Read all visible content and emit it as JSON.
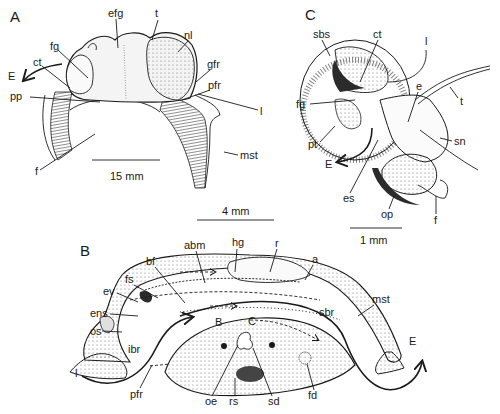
{
  "figure": {
    "panels": [
      {
        "id": "A",
        "label": "A",
        "scale_bar": "15 mm",
        "labels": [
          "efg",
          "t",
          "nl",
          "fg",
          "ct",
          "E",
          "gfr",
          "pfr",
          "l",
          "pp",
          "mst",
          "f"
        ]
      },
      {
        "id": "B",
        "label": "B",
        "scale_bar": "4 mm",
        "labels": [
          "abm",
          "hg",
          "r",
          "a",
          "bf",
          "fs",
          "ev",
          "ens",
          "os",
          "ibr",
          "l",
          "pfr",
          "B",
          "C",
          "sbr",
          "mst",
          "E",
          "oe",
          "rs",
          "sd",
          "fd"
        ]
      },
      {
        "id": "C",
        "label": "C",
        "scale_bar": "1 mm",
        "labels": [
          "sbs",
          "ct",
          "l",
          "e",
          "t",
          "fg",
          "sn",
          "pt",
          "E",
          "es",
          "op",
          "f"
        ]
      }
    ]
  },
  "text": {
    "A": {
      "panel": "A",
      "efg": "efg",
      "t": "t",
      "nl": "nl",
      "fg": "fg",
      "ct": "ct",
      "E": "E",
      "gfr": "gfr",
      "pfr": "pfr",
      "l": "l",
      "pp": "pp",
      "mst": "mst",
      "f": "f",
      "scale": "15 mm"
    },
    "B": {
      "panel": "B",
      "abm": "abm",
      "hg": "hg",
      "r": "r",
      "a": "a",
      "bf": "bf",
      "fs": "fs",
      "ev": "ev",
      "ens": "ens",
      "os": "os",
      "ibr": "ibr",
      "l": "l",
      "pfr": "pfr",
      "flowB": "B",
      "flowC": "C",
      "sbr": "sbr",
      "mst": "mst",
      "E": "E",
      "oe": "oe",
      "rs": "rs",
      "sd": "sd",
      "fd": "fd",
      "scale": "4 mm"
    },
    "C": {
      "panel": "C",
      "sbs": "sbs",
      "ct": "ct",
      "l": "l",
      "e": "e",
      "t": "t",
      "fg": "fg",
      "sn": "sn",
      "pt": "pt",
      "E": "E",
      "es": "es",
      "op": "op",
      "f": "f",
      "scale": "1 mm"
    }
  }
}
